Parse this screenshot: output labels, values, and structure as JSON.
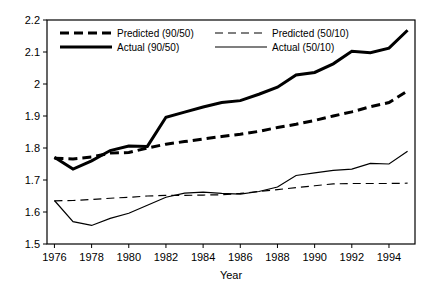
{
  "chart_data": {
    "type": "line",
    "title": "",
    "xlabel": "Year",
    "ylabel": "",
    "xlim": [
      1975.6,
      1995.4
    ],
    "ylim": [
      1.5,
      2.2
    ],
    "grid": false,
    "legend_position": "top-inside",
    "xticks": [
      "1976",
      "1978",
      "1980",
      "1982",
      "1984",
      "1986",
      "1988",
      "1990",
      "1992",
      "1994"
    ],
    "xtick_values": [
      1976,
      1978,
      1980,
      1982,
      1984,
      1986,
      1988,
      1990,
      1992,
      1994
    ],
    "yticks": [
      "2.2",
      "2.1",
      "2",
      "1.9",
      "1.8",
      "1.7",
      "1.6",
      "1.5"
    ],
    "ytick_values": [
      2.2,
      2.1,
      2.0,
      1.9,
      1.8,
      1.7,
      1.6,
      1.5
    ],
    "x": [
      1976,
      1977,
      1978,
      1979,
      1980,
      1981,
      1982,
      1983,
      1984,
      1985,
      1986,
      1987,
      1988,
      1989,
      1990,
      1991,
      1992,
      1993,
      1994,
      1995
    ],
    "series": [
      {
        "name": "Predicted (90/50)",
        "style": "dashed-thick",
        "color": "#000000",
        "values": [
          1.768,
          1.766,
          1.772,
          1.784,
          1.786,
          1.8,
          1.812,
          1.82,
          1.828,
          1.836,
          1.843,
          1.852,
          1.864,
          1.874,
          1.886,
          1.9,
          1.913,
          1.929,
          1.942,
          1.978
        ]
      },
      {
        "name": "Actual (90/50)",
        "style": "solid-thick",
        "color": "#000000",
        "values": [
          1.771,
          1.734,
          1.76,
          1.792,
          1.806,
          1.805,
          1.896,
          1.912,
          1.928,
          1.942,
          1.948,
          1.968,
          1.99,
          2.028,
          2.036,
          2.063,
          2.102,
          2.098,
          2.112,
          2.168
        ]
      },
      {
        "name": "Predicted (50/10)",
        "style": "dashed-thin",
        "color": "#000000",
        "values": [
          1.635,
          1.636,
          1.639,
          1.643,
          1.646,
          1.65,
          1.652,
          1.652,
          1.653,
          1.654,
          1.658,
          1.664,
          1.67,
          1.676,
          1.682,
          1.688,
          1.689,
          1.689,
          1.689,
          1.69
        ]
      },
      {
        "name": "Actual (50/10)",
        "style": "solid-thin",
        "color": "#000000",
        "values": [
          1.636,
          1.57,
          1.558,
          1.58,
          1.596,
          1.621,
          1.646,
          1.659,
          1.662,
          1.658,
          1.656,
          1.664,
          1.678,
          1.714,
          1.722,
          1.73,
          1.734,
          1.752,
          1.75,
          1.79
        ]
      }
    ],
    "legend": [
      {
        "label": "Predicted (90/50)",
        "style": "dashed-thick"
      },
      {
        "label": "Predicted (50/10)",
        "style": "dashed-thin"
      },
      {
        "label": "Actual (90/50)",
        "style": "solid-thick"
      },
      {
        "label": "Actual (50/10)",
        "style": "solid-thin"
      }
    ]
  }
}
